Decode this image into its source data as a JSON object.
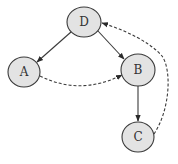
{
  "diagram": {
    "type": "directed-graph",
    "nodes": [
      {
        "id": "D",
        "label": "D",
        "cx": 84,
        "cy": 22,
        "rx": 17,
        "ry": 15
      },
      {
        "id": "A",
        "label": "A",
        "cx": 24,
        "cy": 72,
        "rx": 16,
        "ry": 15
      },
      {
        "id": "B",
        "label": "B",
        "cx": 138,
        "cy": 70,
        "rx": 17,
        "ry": 16
      },
      {
        "id": "C",
        "label": "C",
        "cx": 138,
        "cy": 137,
        "rx": 16,
        "ry": 15
      }
    ],
    "edges": [
      {
        "from": "D",
        "to": "A",
        "style": "solid"
      },
      {
        "from": "D",
        "to": "B",
        "style": "solid"
      },
      {
        "from": "B",
        "to": "C",
        "style": "solid"
      },
      {
        "from": "A",
        "to": "B",
        "style": "dashed",
        "curved": true
      },
      {
        "from": "C",
        "to": "D",
        "style": "dashed",
        "curved": true
      }
    ],
    "colors": {
      "node_fill": "#e3e3e3",
      "stroke": "#3a3a3a",
      "label": "#333333",
      "background": "#ffffff"
    }
  }
}
